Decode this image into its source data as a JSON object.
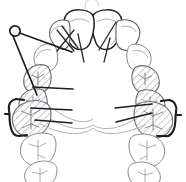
{
  "figure": {
    "view": "occlusal",
    "arch": "maxillary",
    "caption": "",
    "colors": {
      "background": "#ffffff",
      "tooth_outline": "#8a8a92",
      "tooth_outline_emphasis": "#232329",
      "hatch_fill_stroke": "#6a6a72",
      "wire": "#1c1c22",
      "palatal_bar": "#b0b0b8",
      "fissure": "#a3a3ac"
    }
  },
  "appliance": {
    "components": [
      {
        "name": "helical-loop-spring",
        "label": "helical loop",
        "side": "left",
        "position": "anterior-buccal"
      },
      {
        "name": "finger-spring-left",
        "label": "finger spring",
        "side": "left"
      },
      {
        "name": "crossed-wire-left",
        "label": "crossed retention wire",
        "side": "left"
      },
      {
        "name": "adams-clasp-left",
        "label": "Adams clasp",
        "side": "left",
        "tooth": "first molar"
      },
      {
        "name": "adams-clasp-right",
        "label": "Adams clasp",
        "side": "right",
        "tooth": "first molar"
      },
      {
        "name": "palatal-bar",
        "label": "palatal connector bar",
        "side": "center"
      },
      {
        "name": "labial-bow-segment-left",
        "label": "labial bow arm",
        "side": "left"
      },
      {
        "name": "labial-bow-segment-right",
        "label": "labial bow arm",
        "side": "right"
      }
    ]
  },
  "teeth": {
    "shaded_note": "hatched teeth indicate posterior segment teeth under appliance coverage",
    "left_quadrant": [
      {
        "name": "central-incisor-left",
        "shaded": false,
        "emphasis": true
      },
      {
        "name": "lateral-incisor-left",
        "shaded": false,
        "emphasis": false
      },
      {
        "name": "canine-left",
        "shaded": false,
        "emphasis": false
      },
      {
        "name": "first-premolar-left",
        "shaded": true,
        "emphasis": false
      },
      {
        "name": "second-premolar-left",
        "shaded": true,
        "emphasis": false
      },
      {
        "name": "first-molar-left",
        "shaded": true,
        "emphasis": false
      },
      {
        "name": "second-molar-left",
        "shaded": false,
        "emphasis": false
      },
      {
        "name": "third-molar-left",
        "shaded": false,
        "emphasis": false
      }
    ],
    "right_quadrant": [
      {
        "name": "central-incisor-right",
        "shaded": false,
        "emphasis": true
      },
      {
        "name": "lateral-incisor-right",
        "shaded": false,
        "emphasis": false
      },
      {
        "name": "canine-right",
        "shaded": false,
        "emphasis": false
      },
      {
        "name": "first-premolar-right",
        "shaded": true,
        "emphasis": false
      },
      {
        "name": "second-premolar-right",
        "shaded": true,
        "emphasis": false
      },
      {
        "name": "first-molar-right",
        "shaded": true,
        "emphasis": false
      },
      {
        "name": "second-molar-right",
        "shaded": false,
        "emphasis": false
      },
      {
        "name": "third-molar-right",
        "shaded": false,
        "emphasis": false
      }
    ]
  }
}
